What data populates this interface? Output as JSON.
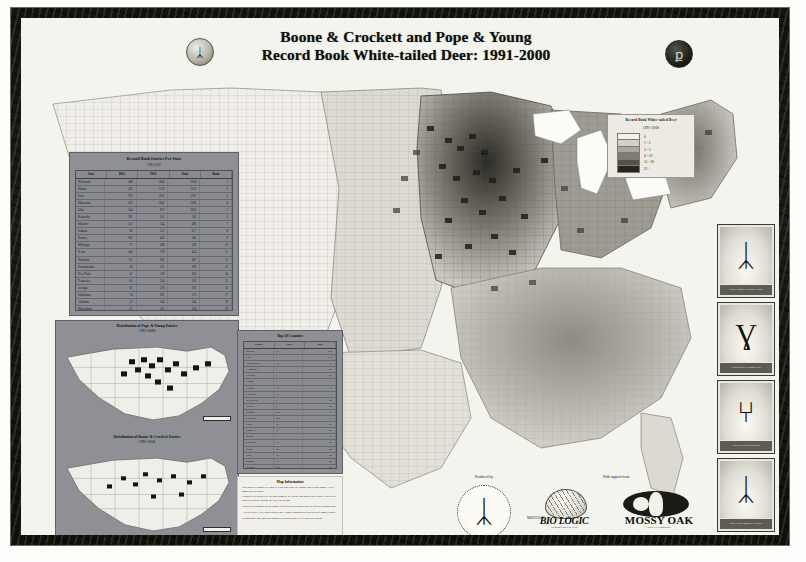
{
  "poster": {
    "title_line1": "Boone & Crockett and Pope & Young",
    "title_line2": "Record Book White-tailed Deer: 1991-2000",
    "seal_left_name": "boone-crockett-club-seal",
    "seal_right_name": "pope-young-club-seal",
    "seal_left_glyph": "ᛣ",
    "seal_right_glyph": "ք"
  },
  "legend": {
    "title_line1": "Record Book White-tailed Deer",
    "title_line2": "1991-2000",
    "entries": [
      {
        "label": "0",
        "color": "#f2f1ec"
      },
      {
        "label": "1 - 2",
        "color": "#d2d0c7"
      },
      {
        "label": "3 - 5",
        "color": "#aaa79c"
      },
      {
        "label": "6 - 10",
        "color": "#7f7d73"
      },
      {
        "label": "11 - 20",
        "color": "#53524a"
      },
      {
        "label": "21 +",
        "color": "#26251f"
      }
    ]
  },
  "state_table": {
    "title": "Record Book Entries Per State",
    "subtitle": "1991-2000",
    "headers": [
      "State",
      "B&C",
      "P&Y",
      "Total",
      "Rank"
    ],
    "rows": [
      [
        "Wisconsin",
        "288",
        "1842",
        "2130",
        "1"
      ],
      [
        "Illinois",
        "241",
        "1310",
        "1551",
        "2"
      ],
      [
        "Iowa",
        "276",
        "1031",
        "1307",
        "3"
      ],
      [
        "Minnesota",
        "163",
        "1043",
        "1206",
        "4"
      ],
      [
        "Ohio",
        "144",
        "872",
        "1016",
        "5"
      ],
      [
        "Kentucky",
        "181",
        "561",
        "742",
        "6"
      ],
      [
        "Missouri",
        "152",
        "534",
        "686",
        "7"
      ],
      [
        "Indiana",
        "96",
        "521",
        "617",
        "8"
      ],
      [
        "Kansas",
        "183",
        "402",
        "585",
        "9"
      ],
      [
        "Michigan",
        "71",
        "498",
        "569",
        "10"
      ],
      [
        "Texas",
        "148",
        "276",
        "424",
        "11"
      ],
      [
        "Nebraska",
        "112",
        "295",
        "407",
        "12"
      ],
      [
        "Pennsylvania",
        "58",
        "331",
        "389",
        "13"
      ],
      [
        "New York",
        "47",
        "318",
        "365",
        "14"
      ],
      [
        "Tennessee",
        "81",
        "244",
        "325",
        "15"
      ],
      [
        "Georgia",
        "63",
        "229",
        "292",
        "16"
      ],
      [
        "Oklahoma",
        "74",
        "201",
        "275",
        "17"
      ],
      [
        "Alabama",
        "52",
        "184",
        "236",
        "18"
      ],
      [
        "Mississippi",
        "61",
        "163",
        "224",
        "19"
      ],
      [
        "Virginia",
        "38",
        "172",
        "210",
        "20"
      ],
      [
        "Arkansas",
        "45",
        "151",
        "196",
        "21"
      ],
      [
        "Montana",
        "52",
        "138",
        "190",
        "22"
      ]
    ]
  },
  "inset_maps": [
    {
      "title_line1": "Distribution of Pope & Young Entries",
      "title_line2": "1991-2000",
      "scale_label": "0   250   500 Miles"
    },
    {
      "title_line1": "Distribution of Boone & Crockett Entries",
      "title_line2": "1991-2000",
      "scale_label": "0   250   500 Miles"
    }
  ],
  "county_table": {
    "title": "Top 50 Counties",
    "headers": [
      "County",
      "State",
      "Total"
    ],
    "rows": [
      [
        "Buffalo",
        "WI",
        "162"
      ],
      [
        "Pike",
        "IL",
        "118"
      ],
      [
        "Trempealeau",
        "WI",
        "96"
      ],
      [
        "Allamakee",
        "IA",
        "88"
      ],
      [
        "Clayton",
        "IA",
        "81"
      ],
      [
        "Adams",
        "IL",
        "77"
      ],
      [
        "Vernon",
        "WI",
        "74"
      ],
      [
        "Crawford",
        "WI",
        "71"
      ],
      [
        "Jo Daviess",
        "IL",
        "68"
      ],
      [
        "Fulton",
        "IL",
        "64"
      ],
      [
        "Winona",
        "MN",
        "61"
      ],
      [
        "Houston",
        "MN",
        "59"
      ],
      [
        "Grant",
        "WI",
        "57"
      ],
      [
        "Schuyler",
        "IL",
        "55"
      ],
      [
        "Brown",
        "IL",
        "52"
      ],
      [
        "Richland",
        "WI",
        "50"
      ],
      [
        "Dunn",
        "WI",
        "48"
      ],
      [
        "Sauk",
        "WI",
        "46"
      ],
      [
        "Monroe",
        "WI",
        "45"
      ],
      [
        "Fillmore",
        "MN",
        "43"
      ],
      [
        "Calhoun",
        "IL",
        "41"
      ],
      [
        "Dubuque",
        "IA",
        "39"
      ],
      [
        "Jackson",
        "WI",
        "38"
      ],
      [
        "Pepin",
        "WI",
        "36"
      ],
      [
        "Wabasha",
        "MN",
        "35"
      ]
    ]
  },
  "map_information": {
    "heading": "Map Information",
    "paragraphs": [
      "Data source: Boone & Crockett Club and Pope & Young Club record books, 1991-2000 entry periods.",
      "Counties are shaded by the total number of typical and non-typical white-tailed deer entries accepted during the ten-year period.",
      "Entries are assigned to the county of harvest as reported on the official scoring chart.",
      "Albers Equal-Area Conic projection. County boundaries current as of 2000 Census.",
      "Cartography and analysis completed using county-level harvest records."
    ]
  },
  "sponsors": {
    "produced_by_label": "Produced by",
    "support_label": "With support from",
    "logos": [
      {
        "name": "Quality Deer Management Association",
        "glyph": "ᛣ"
      },
      {
        "name": "BIO LOGIC",
        "tagline": "Premium Food Plot Seed",
        "pill": "MOSSY OAK"
      },
      {
        "name": "MOSSY OAK",
        "tagline": "Break-Up Camouflage"
      }
    ]
  },
  "photos": [
    {
      "caption": "Typical Boone & Crockett Entry"
    },
    {
      "caption": "Typical Pope & Young Entry"
    },
    {
      "caption": "Non-Typical Record Buck"
    },
    {
      "caption": "Non-Typical Boone & Crockett"
    }
  ]
}
